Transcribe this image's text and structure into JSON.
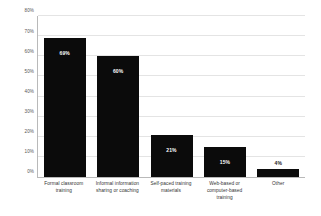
{
  "chart_data": {
    "type": "bar",
    "title": "",
    "xlabel": "",
    "ylabel": "",
    "ylim": [
      0,
      80
    ],
    "grid": true,
    "legend": false,
    "categories": [
      "Formal classroom training",
      "Informal information sharing or coaching",
      "Self-paced training materials",
      "Web-based or computer-based training",
      "Other"
    ],
    "values": [
      69,
      60,
      21,
      15,
      4
    ],
    "value_labels": [
      "69%",
      "60%",
      "21%",
      "15%",
      "4%"
    ],
    "ytick_labels": [
      "0%",
      "10%",
      "20%",
      "30%",
      "40%",
      "50%",
      "60%",
      "70%",
      "80%"
    ],
    "ytick_values": [
      0,
      10,
      20,
      30,
      40,
      50,
      60,
      70,
      80
    ],
    "bar_color": "#0b0b0b",
    "gridline_color": "#e4e4e4",
    "axis_color": "#b9b9b9"
  }
}
